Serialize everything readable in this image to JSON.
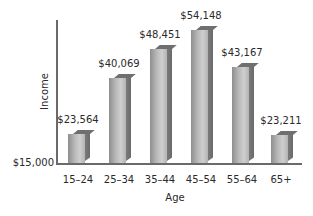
{
  "chart_data": {
    "type": "bar",
    "title": "",
    "xlabel": "Age",
    "ylabel": "Income",
    "categories": [
      "15–24",
      "25–34",
      "35–44",
      "45–54",
      "55–64",
      "65+"
    ],
    "values": [
      23564,
      40069,
      48451,
      54148,
      43167,
      23211
    ],
    "value_labels": [
      "$23,564",
      "$40,069",
      "$48,451",
      "$54,148",
      "$43,167",
      "$23,211"
    ],
    "y_tick_labels": [
      "$15,000"
    ],
    "ylim": [
      15000,
      60000
    ],
    "grid": false,
    "legend": null,
    "style": "3d-bar"
  },
  "axes": {
    "y_title": "Income",
    "x_title": "Age",
    "y_min_label": "$15,000"
  },
  "bars": [
    {
      "category": "15–24",
      "label": "$23,564"
    },
    {
      "category": "25–34",
      "label": "$40,069"
    },
    {
      "category": "35–44",
      "label": "$48,451"
    },
    {
      "category": "45–54",
      "label": "$54,148"
    },
    {
      "category": "55–64",
      "label": "$43,167"
    },
    {
      "category": "65+",
      "label": "$23,211"
    }
  ],
  "colors": {
    "bar_front": "#b9b9b9",
    "bar_side": "#6f6f6f",
    "axis": "#6a6a6a",
    "text": "#2a2a2a"
  }
}
